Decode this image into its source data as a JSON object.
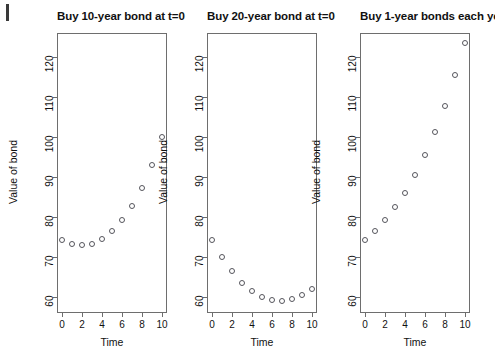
{
  "figure": {
    "background": "#ffffff",
    "axis_color": "#6e6e6e",
    "point_color": "#55555c",
    "text_color": "#111111"
  },
  "chart_data": [
    {
      "type": "scatter",
      "title": "Buy 10-year bond at t=0",
      "xlabel": "Time",
      "ylabel": "Value of bond",
      "xlim": [
        -0.5,
        10.5
      ],
      "ylim": [
        56,
        126
      ],
      "xticks": [
        0,
        2,
        4,
        6,
        8,
        10
      ],
      "yticks": [
        60,
        70,
        80,
        90,
        100,
        110,
        120
      ],
      "grid": false,
      "legend": null,
      "x": [
        0,
        1,
        2,
        3,
        4,
        5,
        6,
        7,
        8,
        9,
        10
      ],
      "values": [
        74.2,
        73.2,
        72.9,
        73.3,
        74.4,
        76.4,
        79.2,
        82.8,
        87.3,
        93.0,
        100.0
      ]
    },
    {
      "type": "scatter",
      "title": "Buy 20-year bond at t=0",
      "xlabel": "Time",
      "ylabel": "Value of bond",
      "xlim": [
        -0.5,
        10.5
      ],
      "ylim": [
        56,
        126
      ],
      "xticks": [
        0,
        2,
        4,
        6,
        8,
        10
      ],
      "yticks": [
        60,
        70,
        80,
        90,
        100,
        110,
        120
      ],
      "grid": false,
      "legend": null,
      "x": [
        0,
        1,
        2,
        3,
        4,
        5,
        6,
        7,
        8,
        9,
        10
      ],
      "values": [
        74.2,
        69.9,
        66.4,
        63.6,
        61.5,
        60.1,
        59.3,
        59.1,
        59.4,
        60.5,
        62.1
      ]
    },
    {
      "type": "scatter",
      "title": "Buy 1-year bonds each year",
      "xlabel": "Time",
      "ylabel": "Value of bond",
      "xlim": [
        -0.5,
        10.5
      ],
      "ylim": [
        56,
        126
      ],
      "xticks": [
        0,
        2,
        4,
        6,
        8,
        10
      ],
      "yticks": [
        60,
        70,
        80,
        90,
        100,
        110,
        120
      ],
      "grid": false,
      "legend": null,
      "x": [
        0,
        1,
        2,
        3,
        4,
        5,
        6,
        7,
        8,
        9,
        10
      ],
      "values": [
        74.2,
        76.6,
        79.3,
        82.4,
        86.1,
        90.5,
        95.5,
        101.2,
        107.7,
        115.4,
        123.5
      ]
    }
  ]
}
